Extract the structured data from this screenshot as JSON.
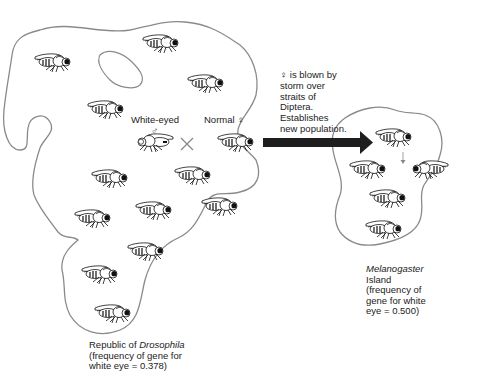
{
  "diagram": {
    "cross": {
      "male_label": "White-eyed",
      "male_symbol": "♂",
      "female_label": "Normal ♀",
      "cross_symbol": "×"
    },
    "migration_caption": {
      "line1": "♀ is blown by",
      "line2": "storm over",
      "line3": "straits of",
      "line4": "Diptera.",
      "line5": "Establishes",
      "line6": "new population."
    },
    "source_population": {
      "name_prefix": "Republic of ",
      "name_italic": "Drosophila",
      "line2": "(frequency of gene for",
      "line3": "white eye = 0.378)",
      "white_eye_frequency": 0.378,
      "fly_count": 14
    },
    "new_population": {
      "name_italic": "Melanogaster",
      "line1": "Island",
      "line2": "(frequency of",
      "line3": "gene for white",
      "line4": "eye = 0.500)",
      "white_eye_frequency": 0.5,
      "fly_count": 5
    },
    "colors": {
      "outline": "#8a8a8a",
      "arrow": "#1e1e1e",
      "fly": "#111111",
      "text": "#222222"
    }
  }
}
